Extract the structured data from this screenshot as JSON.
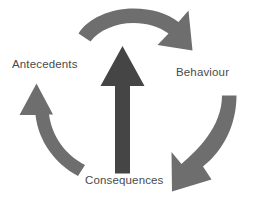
{
  "diagram": {
    "type": "cycle-diagram",
    "background_color": "#ffffff",
    "arrow_color": "#6e6e6e",
    "center_arrow_color": "#454545",
    "label_color": "#4a4a4a",
    "labels": [
      {
        "id": "antecedents",
        "text": "Antecedents",
        "position": "left"
      },
      {
        "id": "behaviour",
        "text": "Behaviour",
        "position": "right"
      },
      {
        "id": "consequences",
        "text": "Consequences",
        "position": "bottom"
      }
    ],
    "arrows": [
      {
        "id": "top-arrow",
        "name": "antecedents-to-behaviour-arrow",
        "direction": "clockwise",
        "from": "Antecedents",
        "to": "Behaviour",
        "color": "#6e6e6e"
      },
      {
        "id": "right-arrow",
        "name": "behaviour-to-consequences-arrow",
        "direction": "clockwise",
        "from": "Behaviour",
        "to": "Consequences",
        "color": "#6e6e6e"
      },
      {
        "id": "left-arrow",
        "name": "consequences-to-antecedents-arrow",
        "direction": "clockwise",
        "from": "Consequences",
        "to": "Antecedents",
        "color": "#6e6e6e"
      },
      {
        "id": "center-arrow",
        "name": "center-upward-arrow",
        "direction": "up",
        "color": "#454545"
      }
    ]
  }
}
